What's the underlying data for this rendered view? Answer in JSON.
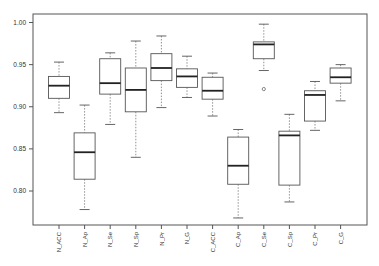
{
  "chart_data": {
    "type": "boxplot",
    "title": "",
    "xlabel": "",
    "ylabel": "",
    "ylim": [
      0.76,
      1.005
    ],
    "yticks": [
      0.8,
      0.85,
      0.9,
      0.95,
      1.0
    ],
    "ytick_labels": [
      "0.80",
      "0.85",
      "0.90",
      "0.95",
      "1.00"
    ],
    "grid": false,
    "legend": null,
    "categories": [
      "N_ACC",
      "N_Ap",
      "N_Se",
      "N_Sp",
      "N_Pr",
      "N_G",
      "C_ACC",
      "C_Ap",
      "C_Se",
      "C_Sp",
      "C_Pr",
      "C_G"
    ],
    "boxes": [
      {
        "label": "N_ACC",
        "whisker_low": 0.893,
        "q1": 0.91,
        "median": 0.925,
        "q3": 0.936,
        "whisker_high": 0.953,
        "outliers": []
      },
      {
        "label": "N_Ap",
        "whisker_low": 0.778,
        "q1": 0.814,
        "median": 0.846,
        "q3": 0.869,
        "whisker_high": 0.902,
        "outliers": []
      },
      {
        "label": "N_Se",
        "whisker_low": 0.879,
        "q1": 0.915,
        "median": 0.928,
        "q3": 0.957,
        "whisker_high": 0.964,
        "outliers": []
      },
      {
        "label": "N_Sp",
        "whisker_low": 0.84,
        "q1": 0.894,
        "median": 0.92,
        "q3": 0.946,
        "whisker_high": 0.978,
        "outliers": []
      },
      {
        "label": "N_Pr",
        "whisker_low": 0.899,
        "q1": 0.931,
        "median": 0.946,
        "q3": 0.963,
        "whisker_high": 0.984,
        "outliers": []
      },
      {
        "label": "N_G",
        "whisker_low": 0.911,
        "q1": 0.923,
        "median": 0.936,
        "q3": 0.945,
        "whisker_high": 0.96,
        "outliers": []
      },
      {
        "label": "C_ACC",
        "whisker_low": 0.889,
        "q1": 0.909,
        "median": 0.919,
        "q3": 0.935,
        "whisker_high": 0.94,
        "outliers": []
      },
      {
        "label": "C_Ap",
        "whisker_low": 0.768,
        "q1": 0.808,
        "median": 0.83,
        "q3": 0.864,
        "whisker_high": 0.873,
        "outliers": []
      },
      {
        "label": "C_Se",
        "whisker_low": 0.943,
        "q1": 0.957,
        "median": 0.974,
        "q3": 0.977,
        "whisker_high": 0.998,
        "outliers": [
          0.921
        ]
      },
      {
        "label": "C_Sp",
        "whisker_low": 0.787,
        "q1": 0.807,
        "median": 0.866,
        "q3": 0.871,
        "whisker_high": 0.891,
        "outliers": []
      },
      {
        "label": "C_Pr",
        "whisker_low": 0.872,
        "q1": 0.883,
        "median": 0.914,
        "q3": 0.919,
        "whisker_high": 0.93,
        "outliers": []
      },
      {
        "label": "C_G",
        "whisker_low": 0.907,
        "q1": 0.928,
        "median": 0.935,
        "q3": 0.946,
        "whisker_high": 0.95,
        "outliers": []
      }
    ]
  },
  "colors": {
    "frame": "#555555",
    "box_stroke": "#555555",
    "median": "#222222",
    "whisker": "#777777",
    "text": "#333333",
    "background": "#ffffff"
  }
}
